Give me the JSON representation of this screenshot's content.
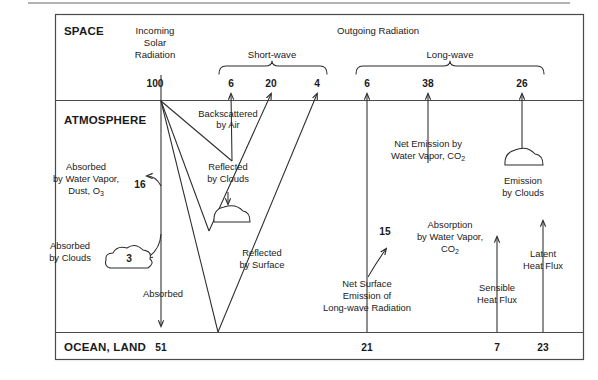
{
  "diagram": {
    "title_space": "SPACE",
    "title_atmosphere": "ATMOSPHERE",
    "title_ocean_land": "OCEAN, LAND",
    "incoming_header": "Incoming",
    "incoming_header2": "Solar",
    "incoming_header3": "Radiation",
    "outgoing_header": "Outgoing Radiation",
    "brace_shortwave": "Short-wave",
    "brace_longwave": "Long-wave",
    "values": {
      "incoming_solar": "100",
      "backscattered_by_air": "6",
      "reflected_by_clouds": "20",
      "reflected_by_surface": "4",
      "net_surface_emission_out": "6",
      "net_emission_water_vapor_co2": "38",
      "emission_by_clouds": "26",
      "absorbed_water_vapor_dust_o3": "16",
      "absorbed_by_clouds": "3",
      "absorbed_surface": "51",
      "absorption_by_water_vapor_co2": "15",
      "net_surface_emission": "21",
      "sensible_heat_flux": "7",
      "latent_heat_flux": "23"
    },
    "labels": {
      "backscattered_by_air_1": "Backscattered",
      "backscattered_by_air_2": "by Air",
      "absorbed_wv_1": "Absorbed",
      "absorbed_wv_2": "by Water Vapor,",
      "absorbed_wv_3a": "Dust, O",
      "absorbed_wv_3b": "3",
      "reflected_clouds_1": "Reflected",
      "reflected_clouds_2": "by Clouds",
      "absorbed_clouds_1": "Absorbed",
      "absorbed_clouds_2": "by Clouds",
      "absorbed_1": "Absorbed",
      "reflected_surface_1": "Reflected",
      "reflected_surface_2": "by Surface",
      "net_emission_1": "Net Emission by",
      "net_emission_2a": "Water Vapor, CO",
      "net_emission_2b": "2",
      "emission_clouds_1": "Emission",
      "emission_clouds_2": "by Clouds",
      "absorption_wv_1": "Absorption",
      "absorption_wv_2": "by Water Vapor,",
      "absorption_wv_3a": "CO",
      "absorption_wv_3b": "2",
      "net_surface_emission_1": "Net Surface",
      "net_surface_emission_2": "Emission of",
      "net_surface_emission_3": "Long-wave Radiation",
      "sensible_1": "Sensible",
      "sensible_2": "Heat Flux",
      "latent_1": "Latent",
      "latent_2": "Heat Flux"
    },
    "colors": {
      "stroke": "#2b2b2b",
      "frame": "#4a4a4a",
      "text": "#1a1a1a",
      "background": "#ffffff"
    }
  }
}
